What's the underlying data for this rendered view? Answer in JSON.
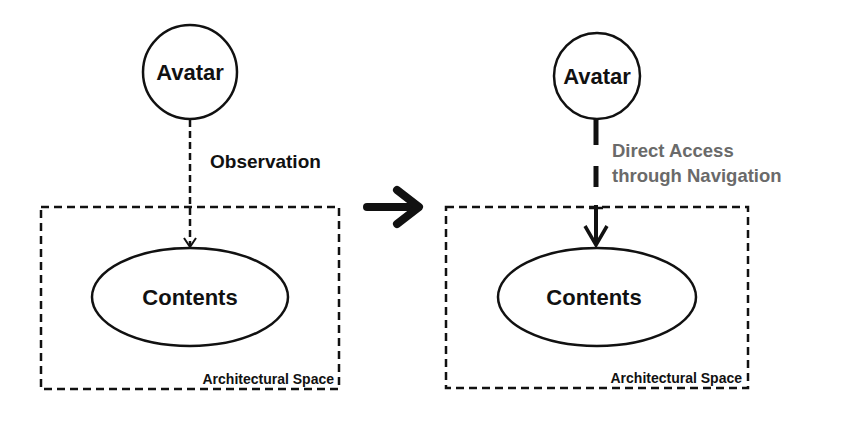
{
  "colors": {
    "ink": "#111111",
    "secondary_text": "#6a6a6a",
    "background": "#ffffff"
  },
  "left_panel": {
    "avatar_label": "Avatar",
    "edge_label": "Observation",
    "edge_style": "thin-dashed-arrow",
    "contents_label": "Contents",
    "container_label": "Architectural Space"
  },
  "transition_arrow": {
    "icon": "right-arrow-icon"
  },
  "right_panel": {
    "avatar_label": "Avatar",
    "edge_label_line1": "Direct Access",
    "edge_label_line2": "through Navigation",
    "edge_style": "thick-dashed-arrow",
    "contents_label": "Contents",
    "container_label": "Architectural Space"
  }
}
